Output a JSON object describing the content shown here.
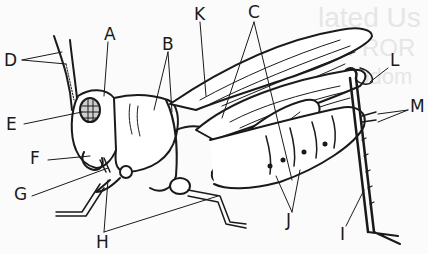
{
  "diagram": {
    "labels": [
      {
        "id": "A",
        "text": "A"
      },
      {
        "id": "B",
        "text": "B"
      },
      {
        "id": "C",
        "text": "C"
      },
      {
        "id": "D",
        "text": "D"
      },
      {
        "id": "E",
        "text": "E"
      },
      {
        "id": "F",
        "text": "F"
      },
      {
        "id": "G",
        "text": "G"
      },
      {
        "id": "H",
        "text": "H"
      },
      {
        "id": "I",
        "text": "I"
      },
      {
        "id": "J",
        "text": "J"
      },
      {
        "id": "K",
        "text": "K"
      },
      {
        "id": "L",
        "text": "L"
      },
      {
        "id": "M",
        "text": "M"
      }
    ],
    "background_bleed_text": [
      "lated Us",
      "NFROR",
      "abdom"
    ],
    "colors": {
      "ink": "#1a1a1a",
      "paper": "#fbfbfb",
      "bleed": "#e6e6e6"
    }
  }
}
